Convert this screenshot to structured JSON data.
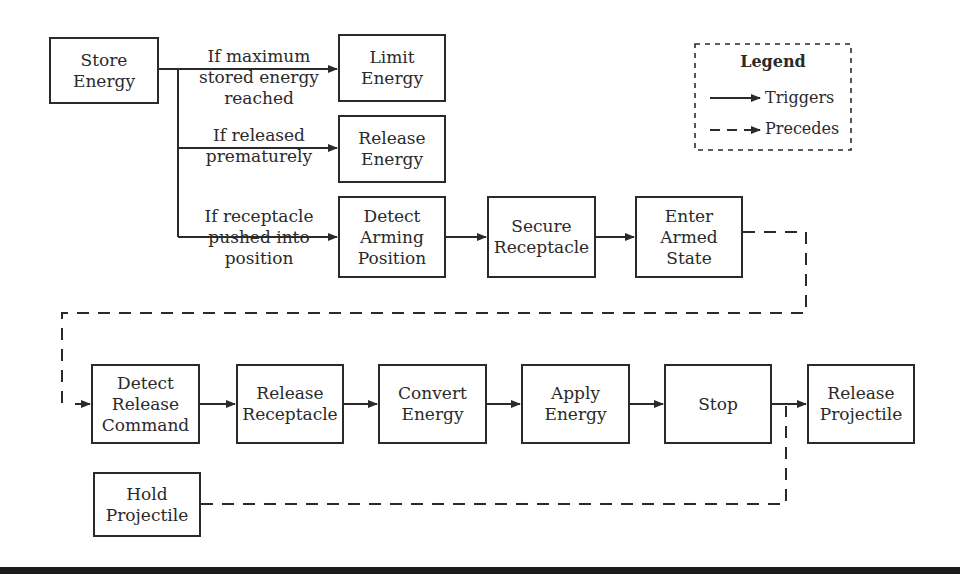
{
  "diagram": {
    "nodes": [
      {
        "id": "store_energy",
        "label": "Store\nEnergy",
        "x": 49,
        "y": 37,
        "w": 110,
        "h": 67
      },
      {
        "id": "limit_energy",
        "label": "Limit\nEnergy",
        "x": 338,
        "y": 34,
        "w": 108,
        "h": 68
      },
      {
        "id": "release_energy",
        "label": "Release\nEnergy",
        "x": 338,
        "y": 115,
        "w": 108,
        "h": 68
      },
      {
        "id": "detect_arming_position",
        "label": "Detect\nArming\nPosition",
        "x": 338,
        "y": 196,
        "w": 108,
        "h": 82
      },
      {
        "id": "secure_receptacle",
        "label": "Secure\nReceptacle",
        "x": 487,
        "y": 196,
        "w": 109,
        "h": 82
      },
      {
        "id": "enter_armed_state",
        "label": "Enter\nArmed\nState",
        "x": 635,
        "y": 196,
        "w": 108,
        "h": 82
      },
      {
        "id": "detect_release_command",
        "label": "Detect\nRelease\nCommand",
        "x": 91,
        "y": 364,
        "w": 109,
        "h": 80
      },
      {
        "id": "release_receptacle",
        "label": "Release\nReceptacle",
        "x": 236,
        "y": 364,
        "w": 108,
        "h": 80
      },
      {
        "id": "convert_energy",
        "label": "Convert\nEnergy",
        "x": 378,
        "y": 364,
        "w": 109,
        "h": 80
      },
      {
        "id": "apply_energy",
        "label": "Apply\nEnergy",
        "x": 521,
        "y": 364,
        "w": 109,
        "h": 80
      },
      {
        "id": "stop",
        "label": "Stop",
        "x": 664,
        "y": 364,
        "w": 108,
        "h": 80
      },
      {
        "id": "release_projectile",
        "label": "Release\nProjectile",
        "x": 807,
        "y": 364,
        "w": 108,
        "h": 80
      },
      {
        "id": "hold_projectile",
        "label": "Hold\nProjectile",
        "x": 93,
        "y": 472,
        "w": 108,
        "h": 65
      }
    ],
    "edge_labels": [
      {
        "id": "if_max",
        "text": "If maximum\nstored energy\nreached",
        "x": 186,
        "y": 46,
        "w": 146
      },
      {
        "id": "if_premature",
        "text": "If released\nprematurely",
        "x": 186,
        "y": 125,
        "w": 146
      },
      {
        "id": "if_receptacle",
        "text": "If receptacle\npushed into\nposition",
        "x": 186,
        "y": 206,
        "w": 146
      }
    ],
    "edges": [
      {
        "from": "store_energy",
        "to": "limit_energy",
        "type": "triggers",
        "condition": "If maximum stored energy reached"
      },
      {
        "from": "store_energy",
        "to": "release_energy",
        "type": "triggers",
        "condition": "If released prematurely"
      },
      {
        "from": "store_energy",
        "to": "detect_arming_position",
        "type": "triggers",
        "condition": "If receptacle pushed into position"
      },
      {
        "from": "detect_arming_position",
        "to": "secure_receptacle",
        "type": "triggers"
      },
      {
        "from": "secure_receptacle",
        "to": "enter_armed_state",
        "type": "triggers"
      },
      {
        "from": "enter_armed_state",
        "to": "detect_release_command",
        "type": "precedes"
      },
      {
        "from": "detect_release_command",
        "to": "release_receptacle",
        "type": "triggers"
      },
      {
        "from": "release_receptacle",
        "to": "convert_energy",
        "type": "triggers"
      },
      {
        "from": "convert_energy",
        "to": "apply_energy",
        "type": "triggers"
      },
      {
        "from": "apply_energy",
        "to": "stop",
        "type": "triggers"
      },
      {
        "from": "stop",
        "to": "release_projectile",
        "type": "triggers"
      },
      {
        "from": "hold_projectile",
        "to": "release_projectile",
        "type": "precedes"
      }
    ]
  },
  "legend": {
    "title": "Legend",
    "items": [
      {
        "label": "Triggers",
        "style": "solid-arrow"
      },
      {
        "label": "Precedes",
        "style": "dashed-arrow"
      }
    ]
  },
  "colors": {
    "line": "#2a2a2a",
    "background": "#ffffff",
    "bottom_bar": "#1c1c1c"
  }
}
